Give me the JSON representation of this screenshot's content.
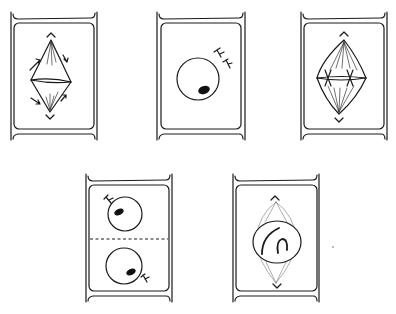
{
  "diagram": {
    "title": "",
    "stroke_color": "#1a1a1a",
    "background": "#ffffff",
    "panels": [
      {
        "id": "p1",
        "position": "top-left",
        "stage_depicted": "anaphase",
        "features": [
          "spindle",
          "centrosomes",
          "equatorial-line",
          "arrows"
        ]
      },
      {
        "id": "p2",
        "position": "top-center",
        "stage_depicted": "interphase",
        "features": [
          "nucleus",
          "nucleolus",
          "centrosomes"
        ]
      },
      {
        "id": "p3",
        "position": "top-right",
        "stage_depicted": "metaphase",
        "features": [
          "spindle",
          "centrosomes",
          "chromosomes-on-plate"
        ]
      },
      {
        "id": "p4",
        "position": "bottom-left",
        "stage_depicted": "telophase-cytokinesis",
        "features": [
          "two-nuclei",
          "nucleoli",
          "centrosomes",
          "cell-plate-dashed"
        ]
      },
      {
        "id": "p5",
        "position": "bottom-right",
        "stage_depicted": "prophase",
        "features": [
          "nucleus",
          "condensing-chromosomes",
          "faint-spindle",
          "centrosomes"
        ]
      }
    ]
  }
}
